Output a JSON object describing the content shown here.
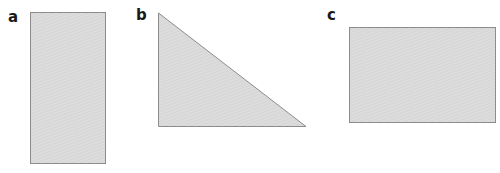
{
  "panels": [
    {
      "label": "a",
      "shape": "rectangle",
      "label_pos": [
        8,
        10
      ]
    },
    {
      "label": "b",
      "shape": "right-triangle",
      "label_pos": [
        136,
        9
      ]
    },
    {
      "label": "c",
      "shape": "rectangle",
      "label_pos": [
        326,
        9
      ]
    }
  ],
  "colors": {
    "fill": "#d9d9d9",
    "stroke": "#8c8c8c"
  }
}
